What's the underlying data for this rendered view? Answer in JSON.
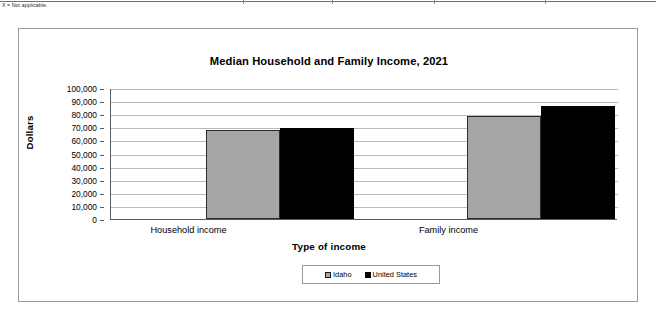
{
  "page": {
    "footnote": "X = Not applicable."
  },
  "chart_data": {
    "type": "bar",
    "title": "Median Household and Family Income, 2021",
    "xlabel": "Type of income",
    "ylabel": "Dollars",
    "categories": [
      "Household income",
      "Family income"
    ],
    "series": [
      {
        "name": "Idaho",
        "values": [
          68000,
          79000
        ],
        "color": "#a6a6a6"
      },
      {
        "name": "United States",
        "values": [
          69700,
          86000
        ],
        "color": "#000000"
      }
    ],
    "ylim": [
      0,
      100000
    ],
    "ytick_labels": [
      "100,000",
      "90,000",
      "80,000",
      "70,000",
      "60,000",
      "50,000",
      "40,000",
      "30,000",
      "20,000",
      "10,000",
      "0"
    ],
    "ytick_values": [
      100000,
      90000,
      80000,
      70000,
      60000,
      50000,
      40000,
      30000,
      20000,
      10000,
      0
    ],
    "grid": true,
    "legend_position": "bottom"
  }
}
